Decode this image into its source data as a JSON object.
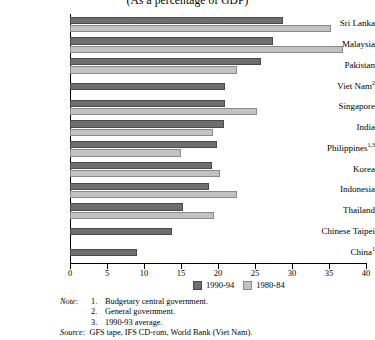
{
  "chart_data": {
    "type": "bar",
    "orientation": "horizontal",
    "title": "(As a percentage of GDP)",
    "xlabel": "",
    "ylabel": "",
    "xlim": [
      0,
      40
    ],
    "xticks": [
      0,
      5,
      10,
      15,
      20,
      25,
      30,
      35,
      40
    ],
    "grid": false,
    "legend_position": "bottom-right",
    "categories": [
      "Sri Lanka",
      "Malaysia",
      "Pakistan",
      "Viet Nam",
      "Singapore",
      "India",
      "Philippines",
      "Korea",
      "Indonesia",
      "Thailand",
      "Chinese Taipei",
      "China"
    ],
    "category_footnotes": [
      "",
      "",
      "",
      "2",
      "",
      "",
      "1,3",
      "",
      "",
      "",
      "",
      "1"
    ],
    "series": [
      {
        "name": "1990-94",
        "color": "#6e6e6e",
        "values": [
          28.8,
          27.4,
          25.8,
          21.0,
          21.0,
          20.8,
          19.9,
          19.2,
          18.8,
          15.3,
          13.8,
          9.0
        ]
      },
      {
        "name": "1980-84",
        "color": "#c2c2c2",
        "values": [
          35.3,
          36.9,
          22.6,
          null,
          25.3,
          19.3,
          15.0,
          20.3,
          22.5,
          19.4,
          null,
          null
        ]
      }
    ]
  },
  "legend": {
    "entries": [
      {
        "label": "1990-94",
        "swatch": "recent"
      },
      {
        "label": "1980-84",
        "swatch": "older"
      }
    ]
  },
  "notes": {
    "kicker": "Note:",
    "items": [
      {
        "num": "1.",
        "text": "Budgetary central government."
      },
      {
        "num": "2.",
        "text": "General government."
      },
      {
        "num": "3.",
        "text": "1990-93 average."
      }
    ],
    "source_kicker": "Source:",
    "source_text": "GFS tape, IFS CD-rom, World Bank (Viet Nam)."
  }
}
